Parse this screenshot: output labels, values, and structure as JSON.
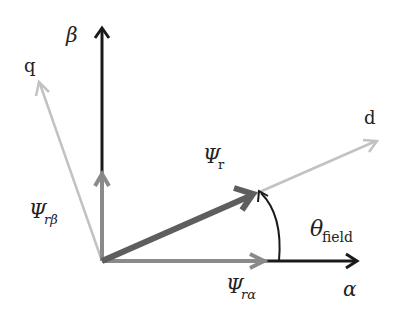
{
  "diagram": {
    "type": "vector-diagram",
    "axes": {
      "alpha": {
        "label": "α",
        "color": "#1a1a1a"
      },
      "beta": {
        "label": "β",
        "color": "#1a1a1a"
      },
      "d": {
        "label": "d",
        "color": "#bdbdbd"
      },
      "q": {
        "label": "q",
        "color": "#bdbdbd"
      }
    },
    "vectors": {
      "psi_r": {
        "label": "Ψ",
        "subscript": "r",
        "color": "#5e5e5e"
      },
      "psi_r_alpha": {
        "label": "Ψ",
        "subscript": "rα",
        "color": "#8a8a8a"
      },
      "psi_r_beta": {
        "label": "Ψ",
        "subscript": "rβ",
        "color": "#8a8a8a"
      }
    },
    "angle": {
      "label": "θ",
      "subscript": "field",
      "color": "#1a1a1a"
    }
  }
}
